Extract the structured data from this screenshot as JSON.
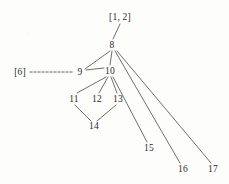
{
  "diagram": {
    "type": "directed-graph",
    "background_color": "#fdfdfc",
    "edge_color": "#555555",
    "text_color": "#2b2b2b",
    "nodes": [
      {
        "id": "8",
        "label": "8",
        "x": 112,
        "y": 45
      },
      {
        "id": "9",
        "label": "9",
        "x": 80,
        "y": 72
      },
      {
        "id": "10",
        "label": "10",
        "x": 110,
        "y": 71
      },
      {
        "id": "11",
        "label": "11",
        "x": 74,
        "y": 99
      },
      {
        "id": "12",
        "label": "12",
        "x": 97,
        "y": 99
      },
      {
        "id": "13",
        "label": "13",
        "x": 118,
        "y": 99
      },
      {
        "id": "14",
        "label": "14",
        "x": 94,
        "y": 126
      },
      {
        "id": "15",
        "label": "15",
        "x": 149,
        "y": 148
      },
      {
        "id": "16",
        "label": "16",
        "x": 183,
        "y": 169
      },
      {
        "id": "17",
        "label": "17",
        "x": 213,
        "y": 169
      }
    ],
    "bracket_labels": [
      {
        "id": "root-label",
        "label": "[1, 2]",
        "x": 120,
        "y": 17
      },
      {
        "id": "six-label",
        "label": "[6]",
        "x": 20,
        "y": 72
      }
    ],
    "edges": [
      {
        "from": "[1, 2]",
        "to": "8",
        "style": "solid",
        "x1": 120,
        "y1": 24,
        "x2": 113,
        "y2": 39
      },
      {
        "from": "8",
        "to": "9",
        "style": "solid",
        "x1": 110,
        "y1": 51,
        "x2": 85,
        "y2": 69
      },
      {
        "from": "8",
        "to": "10",
        "style": "solid",
        "x1": 112,
        "y1": 51,
        "x2": 110,
        "y2": 65
      },
      {
        "from": "8",
        "to": "16",
        "style": "solid",
        "x1": 115,
        "y1": 51,
        "x2": 180,
        "y2": 163
      },
      {
        "from": "8",
        "to": "17",
        "style": "solid",
        "x1": 117,
        "y1": 51,
        "x2": 211,
        "y2": 163
      },
      {
        "from": "[6]",
        "to": "9",
        "style": "dashed",
        "x1": 30,
        "y1": 72,
        "x2": 74,
        "y2": 72
      },
      {
        "from": "9",
        "to": "10",
        "style": "solid",
        "x1": 86,
        "y1": 70,
        "x2": 104,
        "y2": 68
      },
      {
        "from": "10",
        "to": "11",
        "style": "solid",
        "x1": 106,
        "y1": 77,
        "x2": 77,
        "y2": 93
      },
      {
        "from": "10",
        "to": "12",
        "style": "solid",
        "x1": 108,
        "y1": 77,
        "x2": 99,
        "y2": 93
      },
      {
        "from": "10",
        "to": "13",
        "style": "solid",
        "x1": 111,
        "y1": 77,
        "x2": 117,
        "y2": 93
      },
      {
        "from": "10",
        "to": "15",
        "style": "solid",
        "x1": 113,
        "y1": 77,
        "x2": 147,
        "y2": 142
      },
      {
        "from": "11",
        "to": "14",
        "style": "solid",
        "x1": 75,
        "y1": 105,
        "x2": 91,
        "y2": 121
      },
      {
        "from": "13",
        "to": "14",
        "style": "solid",
        "x1": 116,
        "y1": 105,
        "x2": 97,
        "y2": 121
      }
    ]
  }
}
